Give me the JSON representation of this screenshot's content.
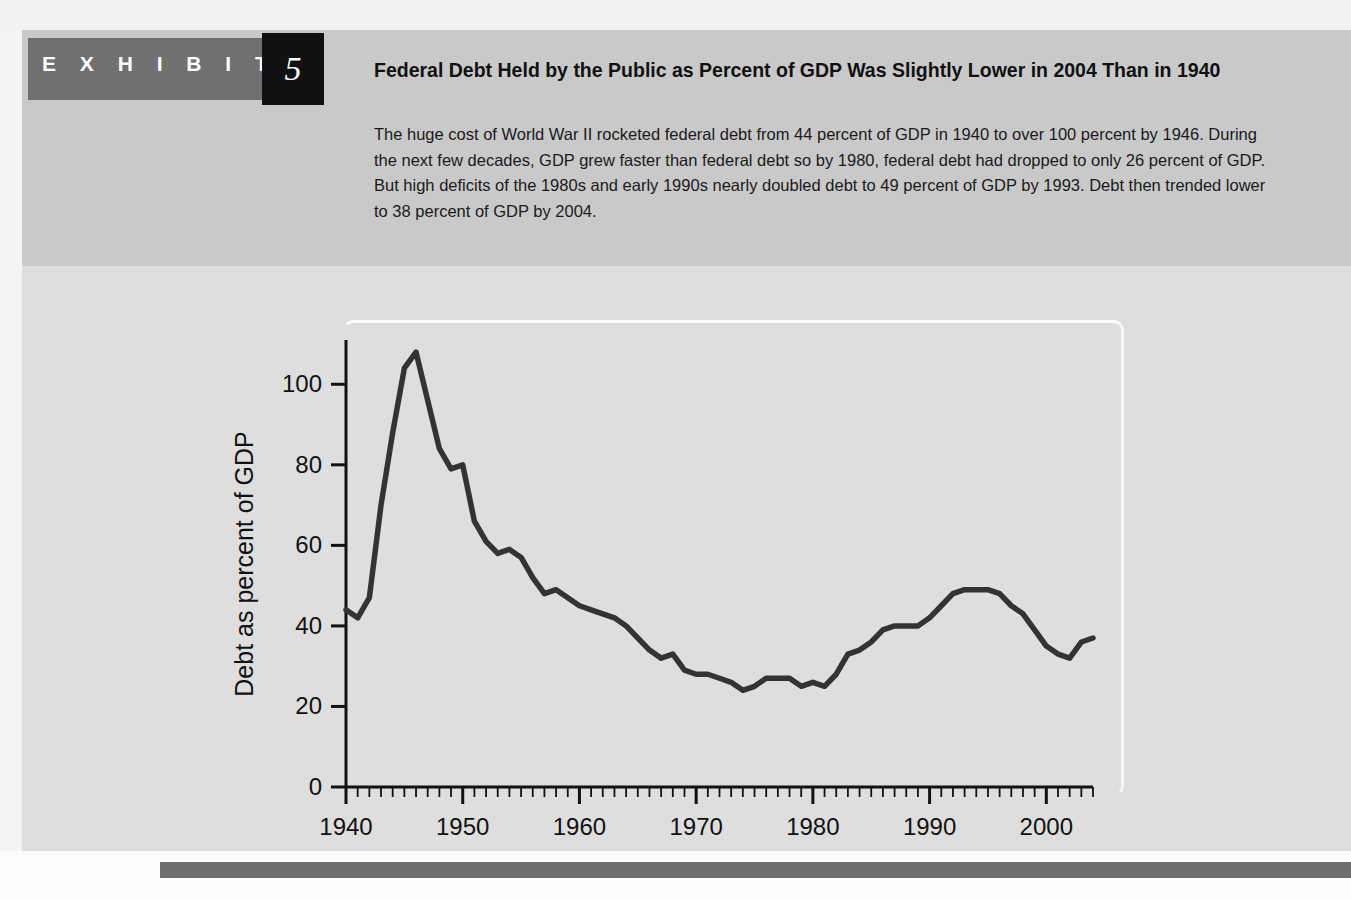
{
  "exhibit": {
    "label": "E X H I B I T",
    "number": "5"
  },
  "heading": "Federal Debt Held by the Public as Percent of GDP Was Slightly Lower in 2004 Than in 1940",
  "body": "The huge cost of World War II rocketed federal debt from 44 percent of GDP in 1940 to over 100 percent by 1946. During the next few decades, GDP grew faster than federal debt so by 1980, federal debt had dropped to only 26 percent of GDP. But high deficits of the 1980s and early 1990s nearly doubled debt to 49 percent of GDP by 1993. Debt then trended lower to 38 percent of GDP by 2004.",
  "colors": {
    "header_band": "#c9c9c9",
    "panel": "#dedede",
    "exhibit_block": "#707070",
    "exhibit_number_box": "#111111",
    "line": "#333333",
    "axis": "#111111",
    "bottom_bar": "#6e6e6e"
  },
  "chart_data": {
    "type": "line",
    "title": "",
    "xlabel": "",
    "ylabel": "Debt as percent of GDP",
    "xlim": [
      1940,
      2004
    ],
    "ylim": [
      0,
      110
    ],
    "grid": false,
    "legend": null,
    "x_ticks_major": [
      1940,
      1950,
      1960,
      1970,
      1980,
      1990,
      2000
    ],
    "x_tick_labels": [
      "1940",
      "1950",
      "1960",
      "1970",
      "1980",
      "1990",
      "2000"
    ],
    "x_minor_tick_interval": 1,
    "y_ticks": [
      0,
      20,
      40,
      60,
      80,
      100
    ],
    "y_tick_labels": [
      "0",
      "20",
      "40",
      "60",
      "80",
      "100"
    ],
    "series": [
      {
        "name": "Federal debt held by the public",
        "x": [
          1940,
          1941,
          1942,
          1943,
          1944,
          1945,
          1946,
          1947,
          1948,
          1949,
          1950,
          1951,
          1952,
          1953,
          1954,
          1955,
          1956,
          1957,
          1958,
          1959,
          1960,
          1961,
          1962,
          1963,
          1964,
          1965,
          1966,
          1967,
          1968,
          1969,
          1970,
          1971,
          1972,
          1973,
          1974,
          1975,
          1976,
          1977,
          1978,
          1979,
          1980,
          1981,
          1982,
          1983,
          1984,
          1985,
          1986,
          1987,
          1988,
          1989,
          1990,
          1991,
          1992,
          1993,
          1994,
          1995,
          1996,
          1997,
          1998,
          1999,
          2000,
          2001,
          2002,
          2003,
          2004
        ],
        "values": [
          44,
          42,
          47,
          70,
          88,
          104,
          108,
          96,
          84,
          79,
          80,
          66,
          61,
          58,
          59,
          57,
          52,
          48,
          49,
          47,
          45,
          44,
          43,
          42,
          40,
          37,
          34,
          32,
          33,
          29,
          28,
          28,
          27,
          26,
          24,
          25,
          27,
          27,
          27,
          25,
          26,
          25,
          28,
          33,
          34,
          36,
          39,
          40,
          40,
          40,
          42,
          45,
          48,
          49,
          49,
          49,
          48,
          45,
          43,
          39,
          35,
          33,
          32,
          36,
          37
        ]
      }
    ],
    "annotations": []
  }
}
